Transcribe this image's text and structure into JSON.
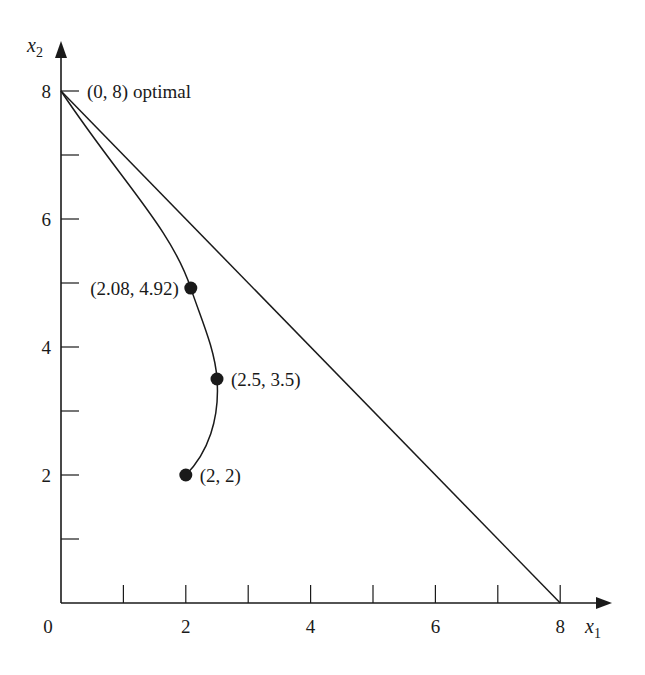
{
  "chart_data": {
    "type": "line",
    "title": "",
    "xlabel": "x1",
    "ylabel": "x2",
    "xlim": [
      0,
      8
    ],
    "ylim": [
      0,
      8
    ],
    "grid": false,
    "x_ticks": [
      0,
      1,
      2,
      3,
      4,
      5,
      6,
      7,
      8
    ],
    "x_tick_labels": [
      "0",
      "",
      "2",
      "",
      "4",
      "",
      "6",
      "",
      "8"
    ],
    "y_ticks": [
      0,
      1,
      2,
      3,
      4,
      5,
      6,
      7,
      8
    ],
    "y_tick_labels": [
      "",
      "",
      "2",
      "",
      "4",
      "",
      "6",
      "",
      "8"
    ],
    "series": [
      {
        "name": "constraint-boundary",
        "style": "line",
        "x": [
          0,
          8
        ],
        "y": [
          8,
          0
        ]
      },
      {
        "name": "interior-path",
        "style": "curve",
        "x": [
          2,
          2.5,
          2.08,
          0
        ],
        "y": [
          2,
          3.5,
          4.92,
          8
        ]
      }
    ],
    "points": [
      {
        "x": 2.08,
        "y": 4.92,
        "label": "(2.08, 4.92)",
        "label_side": "left"
      },
      {
        "x": 2.5,
        "y": 3.5,
        "label": "(2.5, 3.5)",
        "label_side": "right"
      },
      {
        "x": 2,
        "y": 2,
        "label": "(2, 2)",
        "label_side": "right"
      }
    ],
    "annotations": [
      {
        "x": 0,
        "y": 8,
        "text": "(0, 8) optimal"
      }
    ],
    "axis_labels": {
      "x": {
        "main": "x",
        "sub": "1"
      },
      "y": {
        "main": "x",
        "sub": "2"
      }
    }
  }
}
